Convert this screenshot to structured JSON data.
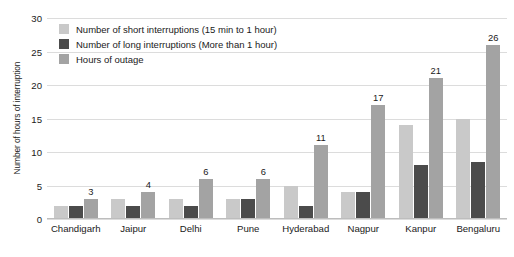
{
  "chart_data": {
    "type": "bar",
    "title": "",
    "xlabel": "",
    "ylabel": "Number of hours of interruption",
    "ylim": [
      0,
      30
    ],
    "yticks": [
      0,
      5,
      10,
      15,
      20,
      25,
      30
    ],
    "grid": true,
    "legend_position": "top-left",
    "categories": [
      "Chandigarh",
      "Jaipur",
      "Delhi",
      "Pune",
      "Hyderabad",
      "Nagpur",
      "Kanpur",
      "Bengaluru"
    ],
    "series": [
      {
        "name": "Number of short interruptions (15 min to 1 hour)",
        "color": "#c9c9c9",
        "values": [
          2,
          3,
          3,
          3,
          5,
          4,
          14,
          15
        ],
        "labels": [
          "",
          "",
          "",
          "",
          "",
          "",
          "",
          ""
        ]
      },
      {
        "name": "Number of long interruptions (More than 1 hour)",
        "color": "#4b4b4b",
        "values": [
          2,
          2,
          2,
          3,
          2,
          4,
          8,
          8.5
        ],
        "labels": [
          "",
          "",
          "",
          "",
          "",
          "",
          "",
          ""
        ]
      },
      {
        "name": "Hours of outage",
        "color": "#a3a3a3",
        "values": [
          3,
          4,
          6,
          6,
          11,
          17,
          21,
          26
        ],
        "labels": [
          "3",
          "4",
          "6",
          "6",
          "11",
          "17",
          "21",
          "26"
        ]
      }
    ]
  }
}
